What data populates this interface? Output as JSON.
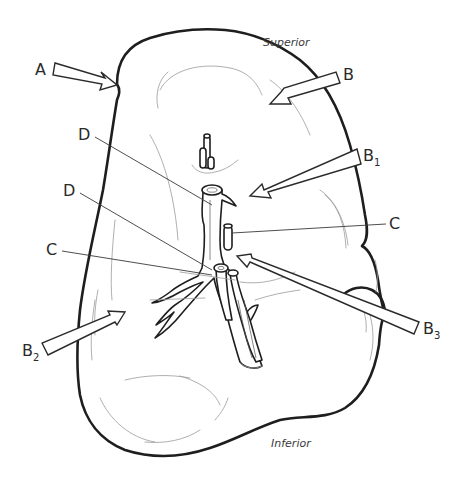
{
  "diagram": {
    "orientation": {
      "superior": "Superior",
      "inferior": "Inferior"
    },
    "labels": {
      "a": {
        "text": "A",
        "sub": ""
      },
      "b": {
        "text": "B",
        "sub": ""
      },
      "b1": {
        "text": "B",
        "sub": "1"
      },
      "b2": {
        "text": "B",
        "sub": "2"
      },
      "b3": {
        "text": "B",
        "sub": "3"
      },
      "c_right": {
        "text": "C",
        "sub": ""
      },
      "c_left": {
        "text": "C",
        "sub": ""
      },
      "d_upper": {
        "text": "D",
        "sub": ""
      },
      "d_lower": {
        "text": "D",
        "sub": ""
      }
    },
    "colors": {
      "line": "#1e1e1e",
      "background": "#ffffff"
    }
  }
}
